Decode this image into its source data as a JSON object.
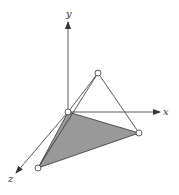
{
  "diagram": {
    "type": "3d-tetrahedron-on-axes",
    "axes": {
      "x_label": "x",
      "y_label": "y",
      "z_label": "z"
    },
    "colors": {
      "line": "#333333",
      "face_fill": "#999999",
      "vertex_fill": "#ffffff"
    },
    "vertices": [
      {
        "name": "origin",
        "px": [
          68,
          112
        ]
      },
      {
        "name": "apex",
        "px": [
          98,
          73
        ]
      },
      {
        "name": "x-vertex",
        "px": [
          139,
          133
        ]
      },
      {
        "name": "z-vertex",
        "px": [
          38,
          168
        ]
      }
    ],
    "shaded_face": [
      "origin",
      "x-vertex",
      "z-vertex"
    ]
  }
}
